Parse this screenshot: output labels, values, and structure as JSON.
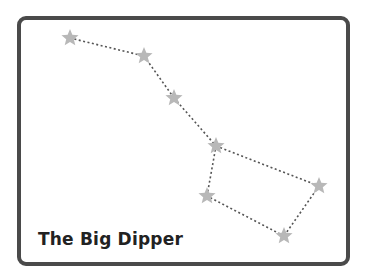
{
  "caption": "The Big Dipper",
  "colors": {
    "frame": "#4a4a4a",
    "star": "#b8b8b8",
    "line": "#555555",
    "text": "#222222"
  },
  "stars": [
    {
      "x": 70,
      "y": 38
    },
    {
      "x": 144,
      "y": 56
    },
    {
      "x": 174,
      "y": 98
    },
    {
      "x": 216,
      "y": 146
    },
    {
      "x": 319,
      "y": 186
    },
    {
      "x": 284,
      "y": 236
    },
    {
      "x": 207,
      "y": 196
    }
  ],
  "connections": [
    [
      0,
      1
    ],
    [
      1,
      2
    ],
    [
      2,
      3
    ],
    [
      3,
      4
    ],
    [
      4,
      5
    ],
    [
      5,
      6
    ],
    [
      6,
      3
    ]
  ]
}
